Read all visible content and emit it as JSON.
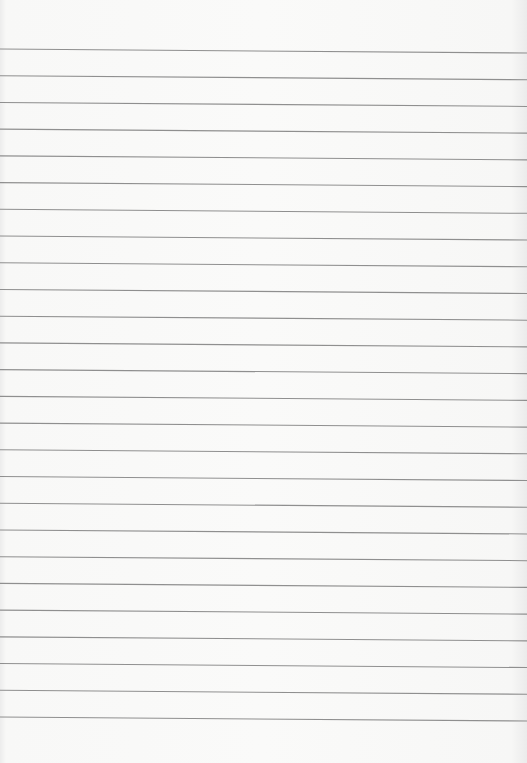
{
  "paper": {
    "type": "lined-paper",
    "line_count": 26,
    "first_line_y": 49,
    "line_spacing": 26.72,
    "slope_px": 4,
    "line_color": "#8f8f8f",
    "background_color": "#f9f9f8"
  }
}
